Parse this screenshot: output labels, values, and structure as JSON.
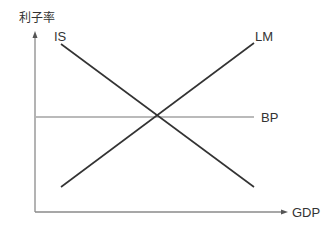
{
  "diagram": {
    "y_axis_label": "利子率",
    "x_axis_label": "GDP",
    "curves": {
      "is": {
        "label": "IS",
        "x1": 61,
        "y1": 44,
        "x2": 254,
        "y2": 187
      },
      "lm": {
        "label": "LM",
        "x1": 61,
        "y1": 187,
        "x2": 254,
        "y2": 43
      },
      "bp": {
        "label": "BP",
        "x1": 36,
        "y1": 117,
        "x2": 254,
        "y2": 117
      }
    },
    "axes": {
      "origin": {
        "x": 35,
        "y": 212
      },
      "y_end": {
        "x": 35,
        "y": 32
      },
      "x_end": {
        "x": 287,
        "y": 212
      }
    },
    "colors": {
      "curve": "#333333",
      "axis": "#888888",
      "bp": "#777777",
      "text": "#333333"
    }
  }
}
